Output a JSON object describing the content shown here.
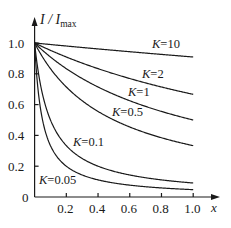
{
  "chart_data": {
    "type": "line",
    "title": "",
    "xlabel": "x",
    "ylabel": "I/I_max",
    "ylabel_main": "I / I",
    "ylabel_sub": "max",
    "xlim": [
      0,
      1.0
    ],
    "ylim": [
      0,
      1.0
    ],
    "grid": false,
    "legend": "inline labels",
    "x_ticks": [
      0.2,
      0.4,
      0.6,
      0.8,
      1.0
    ],
    "x_tick_labels": [
      "0.2",
      "0.4",
      "0.6",
      "0.8",
      "1.0"
    ],
    "y_ticks": [
      0,
      0.2,
      0.4,
      0.6,
      0.8,
      1.0
    ],
    "y_tick_labels": [
      "0",
      "0.2",
      "0.4",
      "0.6",
      "0.8",
      "1.0"
    ],
    "x": [
      0,
      0.1,
      0.2,
      0.3,
      0.4,
      0.5,
      0.6,
      0.7,
      0.8,
      0.9,
      1.0
    ],
    "series": [
      {
        "name": "K=10",
        "K": 10,
        "label_k": "K",
        "label_v": "=10",
        "values": [
          1.0,
          0.99,
          0.98,
          0.97,
          0.96,
          0.95,
          0.94,
          0.93,
          0.93,
          0.92,
          0.91
        ]
      },
      {
        "name": "K=2",
        "K": 2,
        "label_k": "K",
        "label_v": "=2",
        "values": [
          1.0,
          0.95,
          0.91,
          0.87,
          0.83,
          0.8,
          0.77,
          0.74,
          0.71,
          0.69,
          0.67
        ]
      },
      {
        "name": "K=1",
        "K": 1,
        "label_k": "K",
        "label_v": "=1",
        "values": [
          1.0,
          0.91,
          0.83,
          0.77,
          0.71,
          0.67,
          0.63,
          0.59,
          0.56,
          0.53,
          0.5
        ]
      },
      {
        "name": "K=0.5",
        "K": 0.5,
        "label_k": "K",
        "label_v": "=0.5",
        "values": [
          1.0,
          0.83,
          0.71,
          0.63,
          0.56,
          0.5,
          0.45,
          0.42,
          0.38,
          0.36,
          0.33
        ]
      },
      {
        "name": "K=0.1",
        "K": 0.1,
        "label_k": "K",
        "label_v": "=0.1",
        "values": [
          1.0,
          0.5,
          0.33,
          0.25,
          0.2,
          0.17,
          0.14,
          0.13,
          0.11,
          0.1,
          0.09
        ]
      },
      {
        "name": "K=0.05",
        "K": 0.05,
        "label_k": "K",
        "label_v": "=0.05",
        "values": [
          1.0,
          0.33,
          0.2,
          0.14,
          0.11,
          0.09,
          0.08,
          0.07,
          0.06,
          0.05,
          0.05
        ]
      }
    ],
    "label_positions": [
      {
        "series": "K=10",
        "x": 152,
        "y": 48
      },
      {
        "series": "K=2",
        "x": 142,
        "y": 78
      },
      {
        "series": "K=1",
        "x": 128,
        "y": 96
      },
      {
        "series": "K=0.5",
        "x": 112,
        "y": 116
      },
      {
        "series": "K=0.1",
        "x": 73,
        "y": 146
      },
      {
        "series": "K=0.05",
        "x": 39,
        "y": 184
      }
    ]
  }
}
